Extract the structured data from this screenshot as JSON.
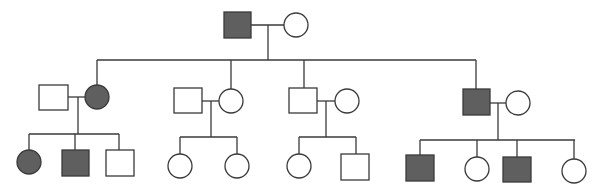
{
  "diagram": {
    "type": "pedigree-chart",
    "colors": {
      "affected": "#5f5f5f",
      "unaffected": "#ffffff",
      "line": "#3a3a3a"
    },
    "generations": [
      {
        "label": "I",
        "members": [
          {
            "id": "I-1",
            "sex": "male",
            "affected": true
          },
          {
            "id": "I-2",
            "sex": "female",
            "affected": false
          }
        ]
      },
      {
        "label": "II",
        "members": [
          {
            "id": "II-1",
            "sex": "male",
            "affected": false,
            "role": "spouse"
          },
          {
            "id": "II-2",
            "sex": "female",
            "affected": true
          },
          {
            "id": "II-3",
            "sex": "male",
            "affected": false,
            "role": "spouse"
          },
          {
            "id": "II-4",
            "sex": "female",
            "affected": false
          },
          {
            "id": "II-5",
            "sex": "male",
            "affected": false
          },
          {
            "id": "II-6",
            "sex": "female",
            "affected": false,
            "role": "spouse"
          },
          {
            "id": "II-7",
            "sex": "male",
            "affected": true
          },
          {
            "id": "II-8",
            "sex": "female",
            "affected": false,
            "role": "spouse"
          }
        ]
      },
      {
        "label": "III",
        "members": [
          {
            "id": "III-1",
            "sex": "female",
            "affected": true,
            "parents": "II-1 x II-2"
          },
          {
            "id": "III-2",
            "sex": "male",
            "affected": true,
            "parents": "II-1 x II-2"
          },
          {
            "id": "III-3",
            "sex": "male",
            "affected": false,
            "parents": "II-1 x II-2"
          },
          {
            "id": "III-4",
            "sex": "female",
            "affected": false,
            "parents": "II-3 x II-4"
          },
          {
            "id": "III-5",
            "sex": "female",
            "affected": false,
            "parents": "II-3 x II-4"
          },
          {
            "id": "III-6",
            "sex": "female",
            "affected": false,
            "parents": "II-5 x II-6"
          },
          {
            "id": "III-7",
            "sex": "male",
            "affected": false,
            "parents": "II-5 x II-6"
          },
          {
            "id": "III-8",
            "sex": "male",
            "affected": true,
            "parents": "II-7 x II-8"
          },
          {
            "id": "III-9",
            "sex": "female",
            "affected": false,
            "parents": "II-7 x II-8"
          },
          {
            "id": "III-10",
            "sex": "male",
            "affected": true,
            "parents": "II-7 x II-8"
          },
          {
            "id": "III-11",
            "sex": "female",
            "affected": false,
            "parents": "II-7 x II-8"
          }
        ]
      }
    ]
  }
}
